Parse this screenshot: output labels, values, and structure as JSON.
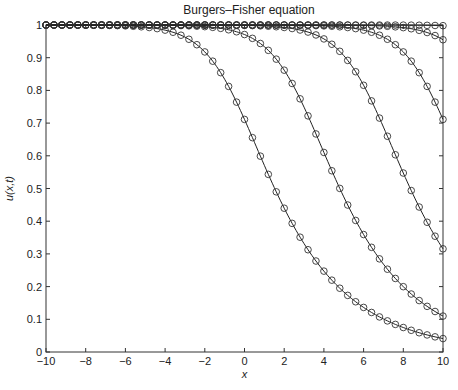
{
  "chart_data": {
    "type": "line",
    "title": "Burgers–Fisher equation",
    "xlabel": "x",
    "ylabel": "u(x,t)",
    "xlim": [
      -10,
      10
    ],
    "ylim": [
      0,
      1
    ],
    "xticks": [
      -10,
      -8,
      -6,
      -4,
      -2,
      0,
      2,
      4,
      6,
      8,
      10
    ],
    "xtick_labels": [
      "−10",
      "−8",
      "−6",
      "−4",
      "−2",
      "0",
      "2",
      "4",
      "6",
      "8",
      "10"
    ],
    "yticks": [
      0,
      0.1,
      0.2,
      0.3,
      0.4,
      0.5,
      0.6,
      0.7,
      0.8,
      0.9,
      1
    ],
    "ytick_labels": [
      "0",
      "0.1",
      "0.2",
      "0.3",
      "0.4",
      "0.5",
      "0.6",
      "0.7",
      "0.8",
      "0.9",
      "1"
    ],
    "grid": false,
    "legend": null,
    "marker": "circle",
    "marker_step": 0.4,
    "model": {
      "form": "u = (1 + exp(k (x - s)))^(-1/3)",
      "k": 0.9
    },
    "x": [
      -10,
      -9,
      -8,
      -7,
      -6,
      -5,
      -4,
      -3,
      -2,
      -1,
      0,
      1,
      2,
      3,
      4,
      5,
      6,
      7,
      8,
      9,
      10
    ],
    "series": [
      {
        "name": "t1",
        "shift": -0.64,
        "values": [
          1.0,
          1.0,
          0.999,
          0.999,
          0.997,
          0.994,
          0.984,
          0.963,
          0.918,
          0.834,
          0.711,
          0.571,
          0.44,
          0.331,
          0.247,
          0.184,
          0.136,
          0.101,
          0.075,
          0.056,
          0.041
        ]
      },
      {
        "name": "t2",
        "shift": 2.64,
        "value_at_x10": 0.11
      },
      {
        "name": "t3",
        "shift": 6.19,
        "value_at_x10": 0.315
      },
      {
        "name": "t4",
        "shift": 9.36,
        "value_at_x10": 0.71
      },
      {
        "name": "t5",
        "shift": 12.12,
        "value_at_x10": 0.955
      },
      {
        "name": "t6",
        "shift": 15.6,
        "value_at_x10": 0.997
      }
    ]
  }
}
